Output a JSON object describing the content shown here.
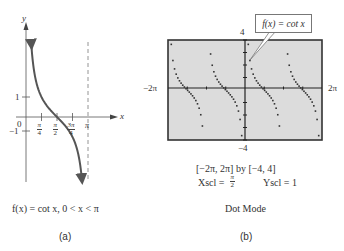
{
  "panel_a": {
    "letter": "(a)",
    "caption": "f(x) = cot x, 0 < x < π",
    "axis_x_label": "x",
    "axis_y_label": "y",
    "origin_label": "0",
    "y_tick_labels": [
      "1",
      "−1"
    ],
    "x_tick_labels": [
      {
        "num": "π",
        "den": "4"
      },
      {
        "num": "π",
        "den": "2"
      },
      {
        "num": "3π",
        "den": "4"
      },
      {
        "num": "π",
        "den": ""
      }
    ],
    "asymptote": "x = π",
    "curve_color": "#555555"
  },
  "panel_b": {
    "letter": "(b)",
    "callout": "f(x) = cot x",
    "y_max_label": "4",
    "y_min_label": "−4",
    "x_min_label": "−2π",
    "x_max_label": "2π",
    "window": "[−2π, 2π] by [−4, 4]",
    "xscl_label": "Xscl =",
    "xscl_num": "π",
    "xscl_den": "2",
    "yscl": "Yscl = 1",
    "mode": "Dot Mode",
    "screen_bg": "#dcdcdc",
    "frame_color": "#333333"
  },
  "chart_data": [
    {
      "type": "line",
      "title": "f(x) = cot x, 0 < x < π",
      "xlabel": "x",
      "ylabel": "y",
      "x_ticks": [
        "π/4",
        "π/2",
        "3π/4",
        "π"
      ],
      "y_ticks": [
        1,
        -1
      ],
      "series": [
        {
          "name": "cot x",
          "x": [
            0.27,
            0.4,
            0.6,
            0.785,
            1.0,
            1.2,
            1.4,
            1.571,
            1.8,
            2.0,
            2.2,
            2.356,
            2.6,
            2.84
          ],
          "values": [
            3.6,
            2.36,
            1.46,
            1.0,
            0.64,
            0.39,
            0.17,
            0.0,
            -0.23,
            -0.46,
            -0.73,
            -1.0,
            -1.67,
            -3.3
          ]
        }
      ],
      "annotations": [
        "vertical asymptote at x = π (dashed)"
      ]
    },
    {
      "type": "scatter",
      "title": "f(x) = cot x (Dot Mode)",
      "xlim": [
        "-2π",
        "2π"
      ],
      "ylim": [
        -4,
        4
      ],
      "xscl": "π/2",
      "yscl": 1,
      "series": [
        {
          "name": "cot x",
          "description": "four branches of cot x with period π, dots plotted over [−2π, 2π]"
        }
      ]
    }
  ]
}
